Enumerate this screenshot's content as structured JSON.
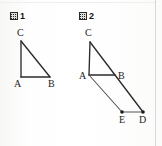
{
  "page": {
    "background_color": "#fdfdfd",
    "ink_color": "#2b2b2b",
    "width": 162,
    "height": 146
  },
  "figures": [
    {
      "id": "figure-1",
      "caption_glyph": "图",
      "caption_number": "1",
      "vertices": [
        {
          "name": "C",
          "label": "C",
          "x": 21,
          "y": 41,
          "label_x": 17,
          "label_y": 28,
          "marker": false
        },
        {
          "name": "A",
          "label": "A",
          "x": 21,
          "y": 77,
          "label_x": 14,
          "label_y": 79,
          "marker": false
        },
        {
          "name": "B",
          "label": "B",
          "x": 50,
          "y": 77,
          "label_x": 48,
          "label_y": 79,
          "marker": false
        }
      ],
      "edges": [
        {
          "name": "C-A",
          "from": "C",
          "to": "A",
          "style": "solid"
        },
        {
          "name": "A-B",
          "from": "A",
          "to": "B",
          "style": "solid"
        },
        {
          "name": "C-B",
          "from": "C",
          "to": "B",
          "style": "solid"
        }
      ]
    },
    {
      "id": "figure-2",
      "caption_glyph": "图",
      "caption_number": "2",
      "vertices": [
        {
          "name": "C",
          "label": "C",
          "x": 90,
          "y": 42,
          "label_x": 85,
          "label_y": 28,
          "marker": false
        },
        {
          "name": "A",
          "label": "A",
          "x": 89,
          "y": 75,
          "label_x": 79,
          "label_y": 71,
          "marker": false
        },
        {
          "name": "B",
          "label": "B",
          "x": 115,
          "y": 75,
          "label_x": 118,
          "label_y": 71,
          "marker": false
        },
        {
          "name": "E",
          "label": "E",
          "x": 122,
          "y": 112,
          "label_x": 119,
          "label_y": 115,
          "marker": true
        },
        {
          "name": "D",
          "label": "D",
          "x": 143,
          "y": 112,
          "label_x": 139,
          "label_y": 115,
          "marker": true
        }
      ],
      "edges": [
        {
          "name": "C-A",
          "from": "C",
          "to": "A",
          "style": "solid"
        },
        {
          "name": "A-B",
          "from": "A",
          "to": "B",
          "style": "solid"
        },
        {
          "name": "C-D",
          "from": "C",
          "to": "D",
          "style": "solid"
        },
        {
          "name": "A-E",
          "from": "A",
          "to": "E",
          "style": "thin"
        },
        {
          "name": "E-D",
          "from": "E",
          "to": "D",
          "style": "thin"
        }
      ]
    }
  ]
}
